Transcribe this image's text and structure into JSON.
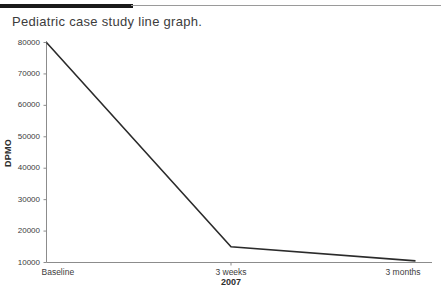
{
  "decor": {
    "top_rule_name": "top-rule"
  },
  "chart_data": {
    "type": "line",
    "title": "Pediatric case study line graph.",
    "xlabel": "2007",
    "ylabel": "DPMO",
    "categories": [
      "Baseline",
      "3 weeks",
      "3 months"
    ],
    "values": [
      80000,
      15000,
      10500
    ],
    "series": [
      {
        "name": "DPMO",
        "values": [
          80000,
          15000,
          10500
        ]
      }
    ],
    "ylim": [
      10000,
      80000
    ],
    "yticks": [
      10000,
      20000,
      30000,
      40000,
      50000,
      60000,
      70000,
      80000
    ],
    "ytick_labels": [
      "10000",
      "20000",
      "30000",
      "40000",
      "50000",
      "60000",
      "70000",
      "80000"
    ],
    "xtick_labels": [
      "Baseline",
      "3 weeks",
      "3 months"
    ],
    "grid": false,
    "legend": false,
    "legend_position": "none",
    "line_color": "#2b2b2b",
    "axis_color": "#8c8c8c",
    "background": "#ffffff"
  }
}
